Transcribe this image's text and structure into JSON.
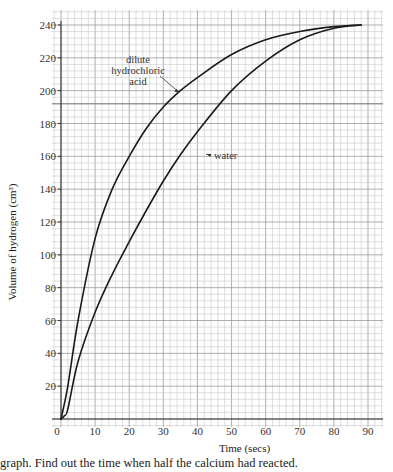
{
  "chart_data": {
    "type": "line",
    "title": "",
    "xlabel": "Time (secs)",
    "ylabel": "Volume of hydrogen (cm³)",
    "xlim": [
      0,
      90
    ],
    "ylim": [
      0,
      240
    ],
    "grid": true,
    "x_ticks": [
      0,
      10,
      20,
      30,
      40,
      50,
      60,
      70,
      80,
      90
    ],
    "y_ticks": [
      20,
      40,
      60,
      80,
      100,
      120,
      140,
      160,
      180,
      200,
      220,
      240
    ],
    "legend": "none (curves labelled directly)",
    "series": [
      {
        "name": "dilute hydrochloric acid",
        "label_lines": [
          "dilute",
          "hydrochloric",
          "acid"
        ],
        "x": [
          0,
          2,
          5,
          10,
          15,
          20,
          25,
          30,
          35,
          40,
          50,
          60,
          70,
          80,
          88
        ],
        "y": [
          0,
          20,
          60,
          110,
          140,
          160,
          177,
          190,
          200,
          208,
          222,
          231,
          236,
          239,
          240
        ]
      },
      {
        "name": "water",
        "label_lines": [
          "water"
        ],
        "x": [
          0,
          1,
          2,
          5,
          10,
          15,
          20,
          25,
          30,
          35,
          40,
          50,
          60,
          70,
          80,
          88
        ],
        "y": [
          0,
          2,
          6,
          35,
          65,
          88,
          108,
          127,
          145,
          161,
          175,
          200,
          218,
          231,
          238,
          240
        ]
      }
    ],
    "annotations": [
      {
        "text": "dilute hydrochloric acid",
        "points_to": [
          35,
          200
        ]
      },
      {
        "text": "water",
        "points_to": [
          42,
          162
        ]
      }
    ],
    "highlighted_gridline_y": 192
  },
  "caption": {
    "text": "graph. Find out the time when half the calcium had reacted."
  },
  "colors": {
    "curve": "#1a1a1a",
    "grid_minor": "#c8c8c8",
    "grid_major": "#9a9a9a",
    "axis": "#333333"
  }
}
